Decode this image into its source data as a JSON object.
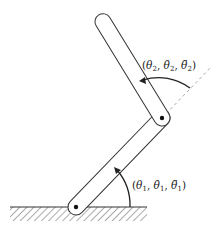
{
  "diagram": {
    "type": "two-link planar manipulator",
    "colors": {
      "stroke": "#333333",
      "dashed": "#aaaaaa",
      "text": "#222222"
    },
    "joint1": {
      "label": "(θ₁, θ̇₁, θ̈₁)",
      "label_parts": [
        "θ",
        "1",
        "θ̇",
        "1",
        "θ̈",
        "1"
      ]
    },
    "joint2": {
      "label": "(θ₂, θ̇₂, θ̈₂)",
      "label_parts": [
        "θ",
        "2",
        "θ̇",
        "2",
        "θ̈",
        "2"
      ]
    },
    "ground": {
      "style": "hatched"
    },
    "extension_line": {
      "style": "dashed"
    }
  }
}
